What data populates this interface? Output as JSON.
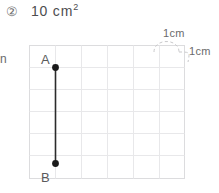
{
  "header": {
    "item_number": "②",
    "answer_value": "10 cm",
    "answer_exponent": "2"
  },
  "margin": {
    "clipped_glyph": "n"
  },
  "figure": {
    "points": [
      {
        "label": "A",
        "col": 1,
        "row": 1
      },
      {
        "label": "B",
        "col": 1,
        "row": 6
      }
    ],
    "segment": {
      "from": "A",
      "to": "B",
      "length_cells": 5
    },
    "grid": {
      "columns": 6,
      "rows": 6,
      "cell_size_cm": 1
    },
    "callouts": [
      {
        "name": "unit-width",
        "text": "1cm"
      },
      {
        "name": "unit-height",
        "text": "1cm"
      }
    ]
  },
  "colors": {
    "grid_line": "#e8e8ea",
    "grid_border": "#dcdcde",
    "segment": "#2b2b2b",
    "point": "#1a1a1a",
    "text": "#5a5a5c",
    "callout_dash": "#c9c9cb"
  }
}
